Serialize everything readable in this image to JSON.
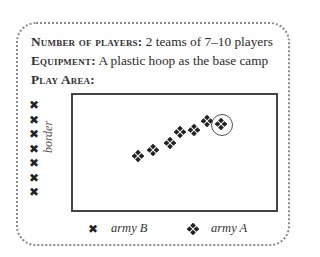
{
  "info": {
    "players": {
      "label": "Number of players:",
      "value": " 2 teams of 7–10 players"
    },
    "equipment": {
      "label": "Equipment:",
      "value": " A plastic hoop as the base camp"
    },
    "play_area": {
      "label": "Play Area:"
    }
  },
  "diagram": {
    "border_label": "border",
    "army_b_marks": [
      {
        "x": 34,
        "y": 105
      },
      {
        "x": 34,
        "y": 120
      },
      {
        "x": 34,
        "y": 134
      },
      {
        "x": 34,
        "y": 149
      },
      {
        "x": 34,
        "y": 163
      },
      {
        "x": 34,
        "y": 178
      },
      {
        "x": 34,
        "y": 192
      }
    ],
    "army_a_marks": [
      {
        "x": 138,
        "y": 156
      },
      {
        "x": 153,
        "y": 150
      },
      {
        "x": 170,
        "y": 143
      },
      {
        "x": 180,
        "y": 132
      },
      {
        "x": 194,
        "y": 130
      },
      {
        "x": 207,
        "y": 121
      },
      {
        "x": 221,
        "y": 124
      }
    ],
    "base_camp_circle": {
      "x": 222,
      "y": 125,
      "r": 11
    },
    "x_glyph": "✖"
  },
  "legend": {
    "army_b": {
      "symbol": "✖",
      "label": "army B"
    },
    "army_a": {
      "symbol": "diamond-cluster",
      "label": "army A"
    }
  }
}
